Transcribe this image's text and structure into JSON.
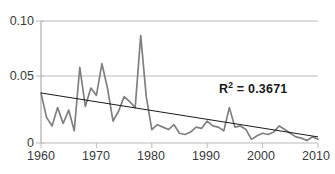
{
  "chart_data": {
    "type": "line",
    "title": "",
    "xlabel": "",
    "ylabel": "",
    "xlim": [
      1960,
      2010
    ],
    "ylim": [
      0,
      0.1
    ],
    "grid": true,
    "legend": false,
    "x_ticks": [
      "1960",
      "1970",
      "1980",
      "1990",
      "2000",
      "2010"
    ],
    "x_tick_values": [
      1960,
      1970,
      1980,
      1990,
      2000,
      2010
    ],
    "y_ticks": [
      "0",
      "0.05",
      "0.10"
    ],
    "y_tick_values": [
      0,
      0.05,
      0.1
    ],
    "x": [
      1960,
      1961,
      1962,
      1963,
      1964,
      1965,
      1966,
      1967,
      1968,
      1969,
      1970,
      1971,
      1972,
      1973,
      1974,
      1975,
      1976,
      1977,
      1978,
      1979,
      1980,
      1981,
      1982,
      1983,
      1984,
      1985,
      1986,
      1987,
      1988,
      1989,
      1990,
      1991,
      1992,
      1993,
      1994,
      1995,
      1996,
      1997,
      1998,
      1999,
      2000,
      2001,
      2002,
      2003,
      2004,
      2005,
      2006,
      2007,
      2008,
      2009,
      2010
    ],
    "series": [
      {
        "name": "observed",
        "color": "#808080",
        "values": [
          0.041,
          0.021,
          0.014,
          0.029,
          0.016,
          0.027,
          0.01,
          0.062,
          0.03,
          0.045,
          0.039,
          0.065,
          0.045,
          0.018,
          0.026,
          0.038,
          0.034,
          0.029,
          0.088,
          0.038,
          0.011,
          0.015,
          0.013,
          0.011,
          0.015,
          0.008,
          0.007,
          0.009,
          0.013,
          0.012,
          0.018,
          0.014,
          0.013,
          0.01,
          0.029,
          0.013,
          0.014,
          0.011,
          0.003,
          0.006,
          0.008,
          0.007,
          0.009,
          0.014,
          0.011,
          0.008,
          0.005,
          0.004,
          0.002,
          0.005,
          0.003
        ]
      }
    ],
    "trendline": {
      "name": "linear-trend",
      "color": "#1a1a1a",
      "x": [
        1960,
        2010
      ],
      "y": [
        0.041,
        0.005
      ]
    },
    "annotations": [
      {
        "name": "r-squared",
        "text_prefix": "R",
        "text_sup": "2",
        "text_suffix": " = 0.3671",
        "value": 0.3671
      }
    ],
    "colors": {
      "series": "#808080",
      "trendline": "#1a1a1a",
      "grid": "#b9b9b9",
      "axis": "#b9b9b9",
      "text": "#3a3a3a",
      "annotation": "#1a1a1a",
      "background": "#ffffff"
    }
  }
}
